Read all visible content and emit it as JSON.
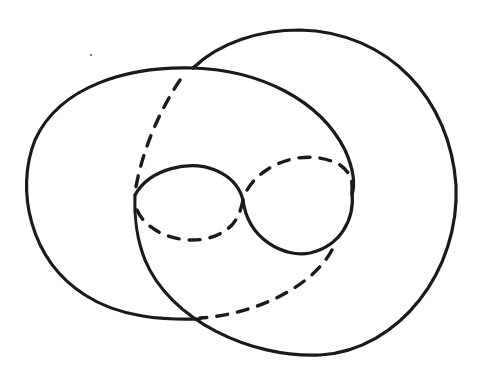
{
  "diagram": {
    "type": "line-drawing",
    "stroke_color": "#1a1a1a",
    "background_color": "#ffffff",
    "elements": [
      {
        "name": "left-oval",
        "style": "solid"
      },
      {
        "name": "right-circle",
        "style": "solid"
      },
      {
        "name": "right-circle-hidden-arc",
        "style": "dashed"
      },
      {
        "name": "figure-eight-left-lobe-top",
        "style": "solid"
      },
      {
        "name": "figure-eight-left-lobe-bottom",
        "style": "dashed"
      },
      {
        "name": "figure-eight-right-lobe-top",
        "style": "dashed"
      },
      {
        "name": "figure-eight-right-lobe-bottom",
        "style": "solid"
      },
      {
        "name": "lower-hidden-arc",
        "style": "dashed"
      }
    ]
  }
}
